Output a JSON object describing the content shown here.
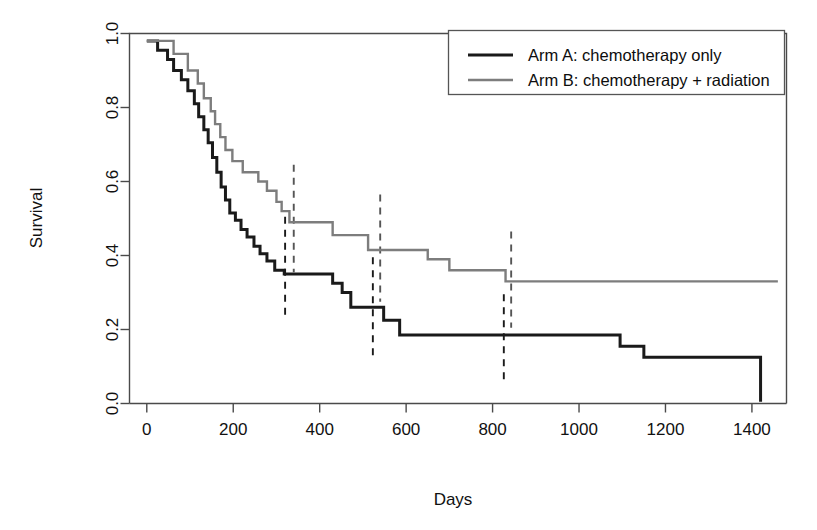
{
  "chart_data": {
    "type": "line",
    "subtype": "kaplan-meier-survival",
    "title": "",
    "xlabel": "Days",
    "ylabel": "Survival",
    "xlim": [
      -40,
      1480
    ],
    "ylim": [
      0.0,
      1.0
    ],
    "grid": false,
    "legend_position": "top-right",
    "xticks": [
      0,
      200,
      400,
      600,
      800,
      1000,
      1200,
      1400
    ],
    "xticklabels": [
      "0",
      "200",
      "400",
      "600",
      "800",
      "1000",
      "1200",
      "1400"
    ],
    "yticks": [
      0.0,
      0.2,
      0.4,
      0.6,
      0.8,
      1.0
    ],
    "yticklabels": [
      "0.0",
      "0.2",
      "0.4",
      "0.6",
      "0.8",
      "1.0"
    ],
    "series": [
      {
        "name": "Arm A: chemotherapy only",
        "color": "#1a1a1a",
        "width": 3.0,
        "style": "solid",
        "steps": [
          [
            0,
            0.98
          ],
          [
            25,
            0.98
          ],
          [
            25,
            0.955
          ],
          [
            48,
            0.955
          ],
          [
            48,
            0.93
          ],
          [
            62,
            0.93
          ],
          [
            62,
            0.9
          ],
          [
            80,
            0.9
          ],
          [
            80,
            0.875
          ],
          [
            95,
            0.875
          ],
          [
            95,
            0.845
          ],
          [
            110,
            0.845
          ],
          [
            110,
            0.81
          ],
          [
            120,
            0.81
          ],
          [
            120,
            0.775
          ],
          [
            132,
            0.775
          ],
          [
            132,
            0.74
          ],
          [
            142,
            0.74
          ],
          [
            142,
            0.705
          ],
          [
            152,
            0.705
          ],
          [
            152,
            0.665
          ],
          [
            162,
            0.665
          ],
          [
            162,
            0.625
          ],
          [
            172,
            0.625
          ],
          [
            172,
            0.585
          ],
          [
            182,
            0.585
          ],
          [
            182,
            0.55
          ],
          [
            192,
            0.55
          ],
          [
            192,
            0.515
          ],
          [
            205,
            0.515
          ],
          [
            205,
            0.495
          ],
          [
            218,
            0.495
          ],
          [
            218,
            0.47
          ],
          [
            232,
            0.47
          ],
          [
            232,
            0.45
          ],
          [
            248,
            0.45
          ],
          [
            248,
            0.425
          ],
          [
            262,
            0.425
          ],
          [
            262,
            0.405
          ],
          [
            278,
            0.405
          ],
          [
            278,
            0.385
          ],
          [
            296,
            0.385
          ],
          [
            296,
            0.36
          ],
          [
            318,
            0.36
          ],
          [
            318,
            0.35
          ],
          [
            430,
            0.35
          ],
          [
            430,
            0.325
          ],
          [
            452,
            0.325
          ],
          [
            452,
            0.3
          ],
          [
            472,
            0.3
          ],
          [
            472,
            0.26
          ],
          [
            548,
            0.26
          ],
          [
            548,
            0.225
          ],
          [
            585,
            0.225
          ],
          [
            585,
            0.185
          ],
          [
            1095,
            0.185
          ],
          [
            1095,
            0.155
          ],
          [
            1150,
            0.155
          ],
          [
            1150,
            0.125
          ],
          [
            1420,
            0.125
          ],
          [
            1420,
            0.005
          ]
        ]
      },
      {
        "name": "Arm B: chemotherapy + radiation",
        "color": "#7d7d7d",
        "width": 2.4,
        "style": "solid",
        "steps": [
          [
            0,
            0.98
          ],
          [
            62,
            0.98
          ],
          [
            62,
            0.945
          ],
          [
            95,
            0.945
          ],
          [
            95,
            0.9
          ],
          [
            118,
            0.9
          ],
          [
            118,
            0.865
          ],
          [
            132,
            0.865
          ],
          [
            132,
            0.825
          ],
          [
            148,
            0.825
          ],
          [
            148,
            0.79
          ],
          [
            158,
            0.79
          ],
          [
            158,
            0.755
          ],
          [
            170,
            0.755
          ],
          [
            170,
            0.72
          ],
          [
            182,
            0.72
          ],
          [
            182,
            0.685
          ],
          [
            198,
            0.685
          ],
          [
            198,
            0.655
          ],
          [
            222,
            0.655
          ],
          [
            222,
            0.625
          ],
          [
            258,
            0.625
          ],
          [
            258,
            0.6
          ],
          [
            278,
            0.6
          ],
          [
            278,
            0.575
          ],
          [
            300,
            0.575
          ],
          [
            300,
            0.545
          ],
          [
            312,
            0.545
          ],
          [
            312,
            0.52
          ],
          [
            330,
            0.52
          ],
          [
            330,
            0.49
          ],
          [
            430,
            0.49
          ],
          [
            430,
            0.455
          ],
          [
            512,
            0.455
          ],
          [
            512,
            0.415
          ],
          [
            650,
            0.415
          ],
          [
            650,
            0.39
          ],
          [
            700,
            0.39
          ],
          [
            700,
            0.36
          ],
          [
            830,
            0.36
          ],
          [
            830,
            0.33
          ],
          [
            1460,
            0.33
          ]
        ]
      }
    ],
    "markers": [
      {
        "name": "arm-a-marker-1",
        "x": 320,
        "y_top": 0.505,
        "y_bottom": 0.225,
        "color": "#1a1a1a"
      },
      {
        "name": "arm-b-marker-1",
        "x": 340,
        "y_top": 0.645,
        "y_bottom": 0.355,
        "color": "#555555"
      },
      {
        "name": "arm-a-marker-2",
        "x": 523,
        "y_top": 0.395,
        "y_bottom": 0.125,
        "color": "#1a1a1a"
      },
      {
        "name": "arm-b-marker-2",
        "x": 540,
        "y_top": 0.565,
        "y_bottom": 0.275,
        "color": "#555555"
      },
      {
        "name": "arm-a-marker-3",
        "x": 826,
        "y_top": 0.295,
        "y_bottom": 0.055,
        "color": "#1a1a1a"
      },
      {
        "name": "arm-b-marker-3",
        "x": 843,
        "y_top": 0.465,
        "y_bottom": 0.205,
        "color": "#555555"
      }
    ]
  },
  "legend": {
    "entries": [
      {
        "label": "Arm A: chemotherapy only",
        "color": "#1a1a1a",
        "width": 3.0
      },
      {
        "label": "Arm B: chemotherapy + radiation",
        "color": "#7d7d7d",
        "width": 2.4
      }
    ]
  }
}
